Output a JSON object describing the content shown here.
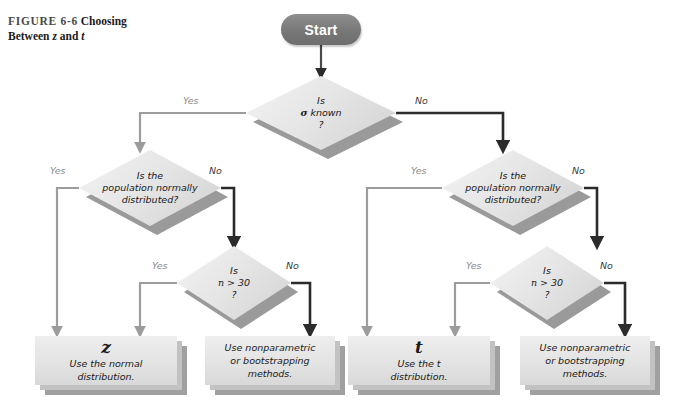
{
  "figure": {
    "number": "FIGURE 6-6",
    "title_part1": "Choosing",
    "title_part2_pre": "Between ",
    "title_sym1": "z",
    "title_mid": " and ",
    "title_sym2": "t"
  },
  "colors": {
    "start_fill": "#777777",
    "node_fill": "#e6e6e6",
    "shadow": "#9a9a9a",
    "wire_dark": "#2b2b2b",
    "wire_light": "#9c9c9c",
    "label_light": "#8d8d8d",
    "label_dark": "#3b3b3b"
  },
  "start": {
    "label": "Start"
  },
  "decisions": {
    "sigma": {
      "line1": "Is",
      "line2_sym": "σ",
      "line2_rest": " known",
      "line3": "?",
      "yes_label": "Yes",
      "no_label": "No"
    },
    "normal_left": {
      "line1": "Is the",
      "line2": "population normally",
      "line3": "distributed?",
      "yes_label": "Yes",
      "no_label": "No"
    },
    "n30_left": {
      "line1": "Is",
      "line2_sym": "n",
      "line2_rest": " > 30",
      "line3": "?",
      "yes_label": "Yes",
      "no_label": "No"
    },
    "normal_right": {
      "line1": "Is the",
      "line2": "population normally",
      "line3": "distributed?",
      "yes_label": "Yes",
      "no_label": "No"
    },
    "n30_right": {
      "line1": "Is",
      "line2_sym": "n",
      "line2_rest": " > 30",
      "line3": "?",
      "yes_label": "Yes",
      "no_label": "No"
    }
  },
  "results": {
    "z": {
      "symbol": "z",
      "line1": "Use the normal",
      "line2": "distribution."
    },
    "nonparametric_left": {
      "line1": "Use nonparametric",
      "line2": "or bootstrapping",
      "line3": "methods."
    },
    "t": {
      "symbol": "t",
      "line1_pre": "Use the ",
      "line1_sym": "t",
      "line2": "distribution."
    },
    "nonparametric_right": {
      "line1": "Use nonparametric",
      "line2": "or bootstrapping",
      "line3": "methods."
    }
  }
}
